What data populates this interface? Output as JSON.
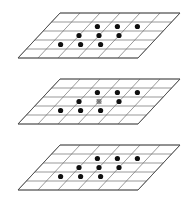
{
  "figure": {
    "background_color": "#ffffff",
    "width": 192,
    "height": 206,
    "plane_count": 3,
    "grid_line_color": "#6e6e6e",
    "outline_color": "#4a4a4a",
    "dot_color": "#101010",
    "center_marker_color": "#9a9a9a"
  },
  "geometry": {
    "shear_dx": 42,
    "plane_width": 120,
    "plane_height": 45,
    "cols": 6,
    "rows": 5,
    "origin_x": 18,
    "plane_tops": [
      13,
      79,
      145
    ],
    "dot_radius": 2.6,
    "center_marker_radius": 2.4
  },
  "planes": [
    {
      "name": "top-plane",
      "label": "Top lattice plane",
      "index": 0,
      "top_y": 13,
      "dot_count": 9,
      "has_center_marker": false,
      "dots": [
        {
          "col": 2.5,
          "row": 1.5
        },
        {
          "col": 3.5,
          "row": 1.5
        },
        {
          "col": 4.5,
          "row": 1.5
        },
        {
          "col": 2.0,
          "row": 2.5
        },
        {
          "col": 3.0,
          "row": 2.5
        },
        {
          "col": 4.0,
          "row": 2.5
        },
        {
          "col": 1.5,
          "row": 3.5
        },
        {
          "col": 2.5,
          "row": 3.5
        },
        {
          "col": 3.5,
          "row": 3.5
        }
      ]
    },
    {
      "name": "middle-plane",
      "label": "Middle lattice plane with central marker",
      "index": 1,
      "top_y": 79,
      "dot_count": 8,
      "has_center_marker": true,
      "center_marker": {
        "col": 3.0,
        "row": 2.5,
        "symbol": "center-reference-marker"
      },
      "dots": [
        {
          "col": 2.5,
          "row": 1.5
        },
        {
          "col": 3.5,
          "row": 1.5
        },
        {
          "col": 4.5,
          "row": 1.5
        },
        {
          "col": 2.0,
          "row": 2.5
        },
        {
          "col": 4.0,
          "row": 2.5
        },
        {
          "col": 1.5,
          "row": 3.5
        },
        {
          "col": 2.5,
          "row": 3.5
        },
        {
          "col": 3.5,
          "row": 3.5
        }
      ]
    },
    {
      "name": "bottom-plane",
      "label": "Bottom lattice plane",
      "index": 2,
      "top_y": 145,
      "dot_count": 9,
      "has_center_marker": false,
      "dots": [
        {
          "col": 2.5,
          "row": 1.5
        },
        {
          "col": 3.5,
          "row": 1.5
        },
        {
          "col": 4.5,
          "row": 1.5
        },
        {
          "col": 2.0,
          "row": 2.5
        },
        {
          "col": 3.0,
          "row": 2.5
        },
        {
          "col": 4.0,
          "row": 2.5
        },
        {
          "col": 1.5,
          "row": 3.5
        },
        {
          "col": 2.5,
          "row": 3.5
        },
        {
          "col": 3.5,
          "row": 3.5
        }
      ]
    }
  ]
}
